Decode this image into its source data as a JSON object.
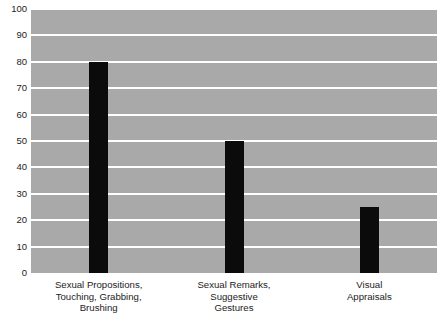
{
  "chart_data": {
    "type": "bar",
    "title": "",
    "xlabel": "",
    "ylabel": "",
    "categories": [
      "Sexual Propositions, Touching, Grabbing, Brushing",
      "Sexual Remarks, Suggestive Gestures",
      "Visual Appraisals"
    ],
    "category_lines": [
      [
        "Sexual Propositions,",
        "Touching, Grabbing,",
        "Brushing"
      ],
      [
        "Sexual Remarks,",
        "Suggestive",
        "Gestures"
      ],
      [
        "Visual",
        "Appraisals"
      ]
    ],
    "values": [
      80,
      50,
      25
    ],
    "ylim": [
      0,
      100
    ],
    "ytick_step": 10,
    "ytick_labels": [
      "100",
      "90",
      "80",
      "70",
      "60",
      "50",
      "40",
      "30",
      "20",
      "10",
      "0"
    ],
    "ytick_values": [
      100,
      90,
      80,
      70,
      60,
      50,
      40,
      30,
      20,
      10,
      0
    ],
    "grid": true,
    "legend": false,
    "colors": {
      "bar": "#0b0b0b",
      "plot_background": "#a9a9a9",
      "gridline": "#ffffff",
      "page_background": "#ffffff",
      "text": "#1c1c1c"
    }
  }
}
